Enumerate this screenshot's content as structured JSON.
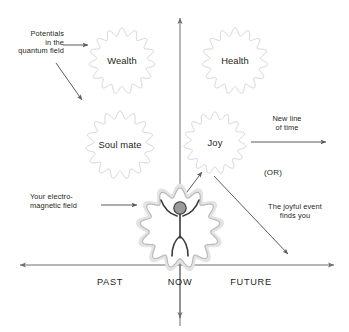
{
  "diagram": {
    "colors": {
      "ink": "#231f20",
      "cloud_stroke": "#d3d3d3",
      "cloud_halo": "#e3e3e3",
      "axis": "#6f6f6f",
      "figure": "#3a3a3a",
      "head_fill": "#9a9a9a",
      "background": "#ffffff"
    },
    "axes": {
      "vertical": {
        "name": "vertical-axis",
        "has_arrow_top": true,
        "has_arrow_bottom": true
      },
      "horizontal": {
        "name": "horizontal-axis",
        "has_arrow_left": true,
        "has_arrow_right": true
      },
      "labels": {
        "past": "PAST",
        "now": "NOW",
        "future": "FUTURE"
      }
    },
    "bubbles": [
      {
        "id": "wealth",
        "label": "Wealth",
        "cx": 122,
        "cy": 61,
        "r": 33
      },
      {
        "id": "health",
        "label": "Health",
        "cx": 235,
        "cy": 61,
        "r": 33
      },
      {
        "id": "soul-mate",
        "label": "Soul mate",
        "cx": 120,
        "cy": 145,
        "r": 34
      },
      {
        "id": "joy",
        "label": "Joy",
        "cx": 215,
        "cy": 143,
        "r": 31
      }
    ],
    "center_figure": {
      "id": "person-in-field",
      "label": "",
      "cx": 180,
      "cy": 228,
      "r": 40
    },
    "annotations": {
      "potentials": "Potentials\nin the\nquantum field",
      "electromagnetic_field": "Your electro-\nmagnetic field",
      "new_line_of_time": "New line\nof time",
      "or": "(OR)",
      "joyful_event": "The joyful event\nfinds you"
    }
  }
}
